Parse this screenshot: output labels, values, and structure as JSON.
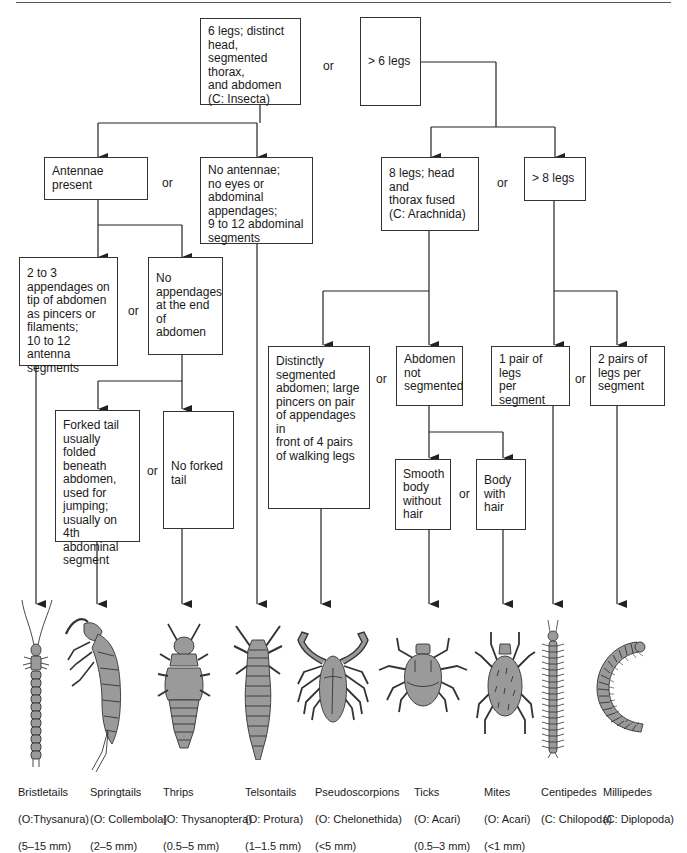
{
  "diagram": {
    "type": "dichotomous-key",
    "boxes": {
      "insecta": "6 legs; distinct\nhead,\nsegmented thorax,\nand abdomen\n(C: Insecta)",
      "more6": "> 6 legs",
      "antennae": "Antennae present",
      "no_antennae": "No antennae;\nno eyes or abdominal\nappendages;\n9 to 12 abdominal\nsegments",
      "appendages_tip": "2 to 3\nappendages on\ntip of abdomen\nas pincers or\nfilaments;\n10 to 12 antenna\nsegments",
      "no_appendages": "No\nappendages\nat the end of\nabdomen",
      "forked_tail": "Forked tail\nusually folded\nbeneath\nabdomen,\nused for\njumping;\nusually on\n4th abdominal\nsegment",
      "no_forked": "No forked\ntail",
      "arachnida": "8 legs; head and\nthorax fused\n(C: Arachnida)",
      "more8": ">  8 legs",
      "segmented_abdomen": "Distinctly\nsegmented\nabdomen; large\npincers on pair\nof appendages in\nfront of 4 pairs\nof walking legs",
      "abdomen_not_seg": "Abdomen\nnot\nsegmented",
      "smooth_body": "Smooth\nbody\nwithout\nhair",
      "body_hair": "Body\nwith\nhair",
      "one_pair": "1 pair of legs\nper\nsegment",
      "two_pairs": "2 pairs of\nlegs per\nsegment"
    },
    "or_label": "or"
  },
  "organisms": [
    {
      "name": "Bristletails",
      "taxon": "(O:Thysanura)",
      "size": "(5–15 mm)"
    },
    {
      "name": "Springtails",
      "taxon": "(O: Collembola)",
      "size": "(2–5 mm)"
    },
    {
      "name": "Thrips",
      "taxon": "(O: Thysanoptera)",
      "size": "(0.5–5 mm)"
    },
    {
      "name": "Telsontails",
      "taxon": "(O: Protura)",
      "size": "(1–1.5 mm)"
    },
    {
      "name": "Pseudoscorpions",
      "taxon": "(O: Chelonethida)",
      "size": "(<5 mm)"
    },
    {
      "name": "Ticks",
      "taxon": "(O: Acari)",
      "size": "(0.5–3 mm)"
    },
    {
      "name": "Mites",
      "taxon": "(O: Acari)",
      "size": "(<1 mm)"
    },
    {
      "name": "Centipedes",
      "taxon": "(C: Chilopoda)",
      "size": ""
    },
    {
      "name": "Millipedes",
      "taxon": "(C: Diplopoda)",
      "size": ""
    }
  ],
  "colors": {
    "line": "#222222",
    "body_fill": "#9a9a9a",
    "body_stroke": "#333333"
  }
}
